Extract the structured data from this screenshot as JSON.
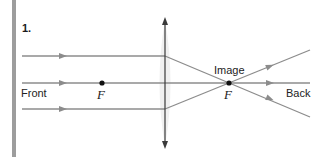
{
  "problem": {
    "number": "1."
  },
  "labels": {
    "front": "Front",
    "back": "Back",
    "image": "Image",
    "focal_front": "F",
    "focal_back": "F"
  },
  "colors": {
    "ray": "#8c8c8c",
    "lens": "#3a3a3a",
    "left_bar": "#9d9d9d",
    "focal_point": "#111111",
    "lens_shading": "#eeeeee"
  },
  "diagram": {
    "type": "converging-lens-ray-diagram",
    "lens_x": 165,
    "axis_y": 83,
    "focal_points": [
      {
        "label": "F",
        "x": 102,
        "y": 83,
        "side": "front"
      },
      {
        "label": "F",
        "x": 229,
        "y": 83,
        "side": "back"
      }
    ],
    "incoming_rays_y": [
      56,
      83,
      109
    ]
  }
}
